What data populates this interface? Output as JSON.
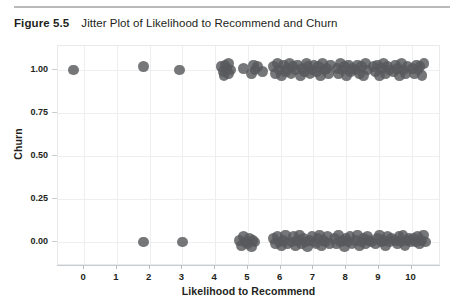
{
  "figure": {
    "label": "Figure 5.5",
    "caption": "Jitter Plot of Likelihood to Recommend and Churn"
  },
  "colors": {
    "point": "#58595b",
    "grid": "#eceef0",
    "axis": "#c9ccce",
    "rule": "#b7b9bb",
    "text": "#231f20"
  },
  "chart_data": {
    "type": "scatter",
    "title": "Jitter Plot of Likelihood to Recommend and Churn",
    "xlabel": "Likelihood to Recommend",
    "ylabel": "Churn",
    "xlim": [
      -0.8,
      10.9
    ],
    "ylim": [
      -0.14,
      1.14
    ],
    "xticks": [
      0,
      1,
      2,
      3,
      4,
      5,
      6,
      7,
      8,
      9,
      10
    ],
    "xtick_labels": [
      "0",
      "1",
      "2",
      "3",
      "4",
      "5",
      "6",
      "7",
      "8",
      "9",
      "10"
    ],
    "yticks": [
      0.0,
      0.25,
      0.5,
      0.75,
      1.0
    ],
    "ytick_labels": [
      "0.00",
      "0.25",
      "0.50",
      "0.75",
      "1.00"
    ],
    "grid": true,
    "legend": null,
    "marker": "circle",
    "marker_size": 5.4,
    "marker_color": "#58595b",
    "marker_opacity": 0.82,
    "jitter": "vertical and horizontal jitter applied to binary churn outcome",
    "series": [
      {
        "name": "Churn = 1",
        "y_level": 1.0,
        "x": [
          -0.32,
          1.82,
          2.9,
          4.18,
          4.24,
          4.3,
          4.27,
          4.36,
          4.42,
          4.4,
          4.48,
          4.86,
          5.12,
          5.18,
          5.22,
          5.3,
          5.44,
          5.78,
          5.84,
          5.9,
          5.96,
          6.02,
          6.08,
          6.14,
          6.2,
          6.26,
          6.32,
          6.38,
          6.46,
          6.52,
          6.6,
          6.66,
          6.72,
          6.78,
          6.84,
          6.9,
          6.96,
          7.02,
          7.1,
          7.16,
          7.22,
          7.28,
          7.34,
          7.4,
          7.46,
          7.52,
          7.72,
          7.78,
          7.84,
          7.9,
          7.96,
          8.02,
          8.08,
          8.14,
          8.2,
          8.3,
          8.36,
          8.42,
          8.48,
          8.54,
          8.6,
          8.66,
          8.84,
          8.9,
          8.96,
          9.02,
          9.08,
          9.14,
          9.2,
          9.26,
          9.32,
          9.46,
          9.52,
          9.58,
          9.64,
          9.7,
          9.76,
          9.82,
          9.88,
          10.02,
          10.08,
          10.14,
          10.2,
          10.26,
          10.32,
          10.38
        ],
        "y": [
          1.0,
          1.02,
          1.0,
          1.02,
          0.99,
          1.03,
          0.97,
          1.01,
          0.98,
          1.04,
          1.0,
          1.01,
          0.98,
          1.03,
          1.0,
          1.02,
          0.99,
          1.02,
          0.98,
          1.04,
          1.0,
          0.97,
          1.03,
          0.99,
          1.01,
          1.04,
          0.98,
          1.02,
          1.0,
          1.03,
          0.97,
          1.01,
          0.99,
          1.04,
          1.02,
          0.98,
          1.0,
          1.03,
          0.99,
          1.02,
          0.97,
          1.04,
          1.0,
          1.01,
          0.98,
          1.03,
          1.01,
          0.98,
          1.04,
          1.0,
          1.02,
          0.97,
          1.03,
          0.99,
          1.01,
          1.0,
          1.03,
          0.98,
          1.02,
          0.97,
          1.04,
          1.0,
          1.02,
          0.99,
          1.03,
          0.97,
          1.01,
          1.04,
          0.98,
          1.02,
          1.0,
          0.99,
          1.03,
          1.01,
          0.97,
          1.04,
          1.0,
          0.98,
          1.02,
          1.01,
          0.98,
          1.03,
          1.0,
          1.02,
          0.97,
          1.04
        ]
      },
      {
        "name": "Churn = 0",
        "y_level": 0.0,
        "x": [
          1.8,
          3.0,
          4.74,
          4.8,
          4.86,
          4.92,
          4.98,
          5.04,
          5.1,
          5.16,
          5.22,
          5.78,
          5.84,
          5.9,
          5.96,
          6.02,
          6.08,
          6.14,
          6.2,
          6.34,
          6.4,
          6.46,
          6.52,
          6.58,
          6.64,
          6.7,
          6.76,
          6.82,
          6.88,
          6.96,
          7.02,
          7.08,
          7.14,
          7.2,
          7.26,
          7.32,
          7.38,
          7.44,
          7.5,
          7.64,
          7.7,
          7.76,
          7.82,
          7.88,
          7.94,
          8.0,
          8.06,
          8.12,
          8.18,
          8.3,
          8.36,
          8.42,
          8.48,
          8.54,
          8.6,
          8.66,
          8.72,
          8.78,
          8.9,
          8.96,
          9.02,
          9.08,
          9.14,
          9.2,
          9.26,
          9.32,
          9.38,
          9.5,
          9.56,
          9.62,
          9.68,
          9.74,
          9.8,
          9.86,
          9.92,
          9.98,
          10.06,
          10.12,
          10.18,
          10.24,
          10.3,
          10.36,
          10.42
        ],
        "y": [
          0.0,
          0.0,
          0.01,
          -0.02,
          0.03,
          0.0,
          -0.01,
          0.02,
          -0.03,
          0.01,
          0.0,
          0.02,
          -0.01,
          0.03,
          0.0,
          -0.02,
          0.01,
          0.04,
          -0.01,
          0.0,
          0.03,
          -0.02,
          0.01,
          0.04,
          -0.01,
          0.02,
          0.0,
          -0.03,
          0.01,
          0.03,
          0.0,
          -0.01,
          0.02,
          0.04,
          -0.02,
          0.01,
          0.0,
          0.03,
          -0.01,
          0.02,
          -0.01,
          0.04,
          0.0,
          0.01,
          -0.03,
          0.02,
          0.0,
          0.03,
          -0.01,
          0.01,
          0.04,
          -0.02,
          0.0,
          0.02,
          -0.01,
          0.03,
          0.01,
          0.0,
          -0.01,
          0.02,
          0.04,
          0.0,
          0.01,
          -0.02,
          0.03,
          0.0,
          0.02,
          0.01,
          -0.01,
          0.03,
          0.0,
          0.04,
          -0.02,
          0.01,
          0.02,
          0.0,
          0.02,
          0.0,
          0.03,
          -0.01,
          0.01,
          0.04,
          0.0
        ]
      }
    ]
  }
}
